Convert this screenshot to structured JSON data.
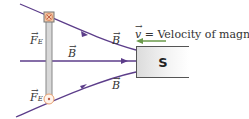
{
  "labels": {
    "force_top": "F",
    "force_top_sub": "E",
    "force_bottom": "F",
    "force_bottom_sub": "E",
    "field_top": "B",
    "field_middle": "B",
    "field_bottom": "B",
    "vector_arrow": "→",
    "velocity_symbol": "v",
    "velocity_text": " = Velocity of magnet",
    "magnet_pole": "S"
  },
  "colors": {
    "field_line": "#5c3d8a",
    "velocity_arrow": "#6a9a4a",
    "rod": "#888888",
    "current_marker": "#e8a070"
  }
}
